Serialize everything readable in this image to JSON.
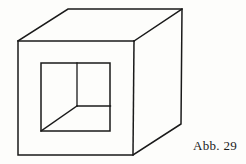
{
  "figure": {
    "caption": "Abb. 29",
    "title": "Abb. 29",
    "stroke_color": "#1a1a1a",
    "background_color": "#fdfdfb",
    "width": 246,
    "height": 164,
    "geometry": {
      "front_face": {
        "name": "front-face",
        "points": "18,41 134,41 133,155 18,155"
      },
      "top_back_edge": {
        "name": "top-back-edge",
        "points": "68,9 182,9"
      },
      "back_right_edge": {
        "name": "back-right-vertical-edge",
        "points": "182,9 181,124"
      },
      "receding_edge_top_left": {
        "name": "receding-edge-top-left",
        "points": "18,41 68,9"
      },
      "receding_edge_top_right": {
        "name": "receding-edge-top-right",
        "points": "134,41 182,9"
      },
      "receding_edge_bottom_right": {
        "name": "receding-edge-bottom-right",
        "points": "133,155 181,124"
      },
      "inner_square": {
        "name": "inner-square-opening",
        "points": "41,63 110,63 110,131 41,131"
      },
      "inner_vertex": {
        "name": "inner-corner-vertex",
        "x": 77,
        "y": 106
      },
      "inner_vertical": {
        "name": "inner-vertical-edge",
        "points": "77,63 77,106"
      },
      "inner_horizontal": {
        "name": "inner-horizontal-edge",
        "points": "77,106 110,106"
      },
      "inner_diagonal": {
        "name": "inner-diagonal-edge",
        "points": "77,106 41,131"
      }
    }
  }
}
